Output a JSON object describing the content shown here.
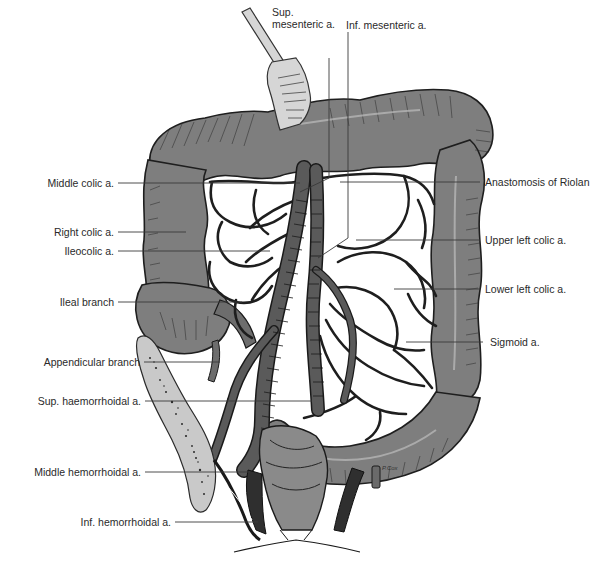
{
  "figure": {
    "type": "anatomical-illustration",
    "artist_signature": "P.Cox",
    "colors": {
      "colon_fill": "#7e7e7e",
      "outline": "#1e1e1e",
      "bone_fill": "#c9c9c9",
      "label_text": "#2a2a2a",
      "leader_line": "#3a3a3a"
    }
  },
  "labels": {
    "top": {
      "sup_mesenteric": {
        "line1": "Sup.",
        "line2": "mesenteric a."
      },
      "inf_mesenteric": "Inf. mesenteric a."
    },
    "left": [
      {
        "id": "middle-colic",
        "text": "Middle colic a."
      },
      {
        "id": "right-colic",
        "text": "Right colic a."
      },
      {
        "id": "ileocolic",
        "text": "Ileocolic a."
      },
      {
        "id": "ileal-branch",
        "text": "Ileal branch"
      },
      {
        "id": "appendicular-branch",
        "text": "Appendicular branch"
      },
      {
        "id": "sup-haemorrhoidal",
        "text": "Sup. haemorrhoidal a."
      },
      {
        "id": "middle-hemorrhoidal",
        "text": "Middle hemorrhoidal a."
      },
      {
        "id": "inf-hemorrhoidal",
        "text": "Inf. hemorrhoidal a."
      }
    ],
    "right": [
      {
        "id": "anastomosis-riolan",
        "text": "Anastomosis of Riolan"
      },
      {
        "id": "upper-left-colic",
        "text": "Upper left colic a."
      },
      {
        "id": "lower-left-colic",
        "text": "Lower left colic a."
      },
      {
        "id": "sigmoid",
        "text": "Sigmoid a."
      }
    ]
  }
}
